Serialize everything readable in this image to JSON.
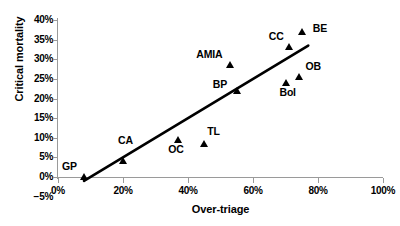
{
  "chart_data": {
    "type": "scatter",
    "title": "",
    "xlabel": "Over-triage",
    "ylabel": "Critical mortality",
    "xlim": [
      0,
      100
    ],
    "ylim": [
      -5,
      40
    ],
    "grid": false,
    "legend": "none",
    "x_ticks": [
      "0%",
      "20%",
      "40%",
      "60%",
      "80%",
      "100%"
    ],
    "x_tick_values": [
      0,
      20,
      40,
      60,
      80,
      100
    ],
    "y_ticks": [
      "40%",
      "35%",
      "30%",
      "25%",
      "20%",
      "15%",
      "10%",
      "5%",
      "0%",
      "−5%"
    ],
    "y_tick_values": [
      40,
      35,
      30,
      25,
      20,
      15,
      10,
      5,
      0,
      -5
    ],
    "points": [
      {
        "label": "GP",
        "x": 8,
        "y": 0,
        "label_dx": -22,
        "label_dy": -16
      },
      {
        "label": "CA",
        "x": 20,
        "y": 4,
        "label_dx": -5,
        "label_dy": -26
      },
      {
        "label": "OC",
        "x": 37,
        "y": 9.5,
        "label_dx": -10,
        "label_dy": 4
      },
      {
        "label": "TL",
        "x": 45,
        "y": 8.5,
        "label_dx": 3,
        "label_dy": -18
      },
      {
        "label": "BP",
        "x": 55,
        "y": 22,
        "label_dx": -24,
        "label_dy": -12
      },
      {
        "label": "AMIA",
        "x": 53,
        "y": 28.5,
        "label_dx": -34,
        "label_dy": -16
      },
      {
        "label": "CC",
        "x": 71,
        "y": 33,
        "label_dx": -20,
        "label_dy": -16
      },
      {
        "label": "Bol",
        "x": 70,
        "y": 24,
        "label_dx": -6,
        "label_dy": 4
      },
      {
        "label": "OB",
        "x": 74,
        "y": 25.5,
        "label_dx": 7,
        "label_dy": -16
      },
      {
        "label": "BE",
        "x": 75,
        "y": 37,
        "label_dx": 11,
        "label_dy": -9
      }
    ],
    "trendline": {
      "x0": 8,
      "y0": -1,
      "x1": 77,
      "y1": 33.5
    },
    "series_color": "#000000",
    "axis_color": "#9a9a9a"
  }
}
